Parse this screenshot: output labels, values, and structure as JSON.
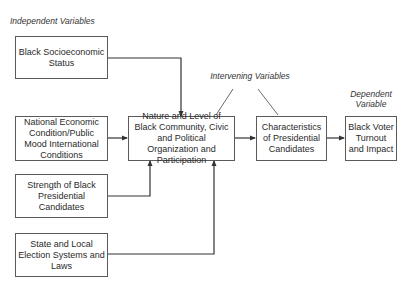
{
  "labels": {
    "independent": "Independent Variables",
    "intervening": "Intervening Variables",
    "dependent_line1": "Dependent",
    "dependent_line2": "Variable"
  },
  "boxes": {
    "socioeconomic": "Black Socioeconomic Status",
    "national": "National Economic Condition/Public Mood International Conditions",
    "strength": "Strength of Black Presidential Candidates",
    "state_local": "State and Local Election Systems and Laws",
    "community": "Nature and Level of Black Community, Civic and Political Organization and Participation",
    "characteristics": "Characteristics of Presidential Candidates",
    "turnout": "Black Voter Turnout and Impact"
  },
  "edges": [
    {
      "from": "socioeconomic",
      "to": "community"
    },
    {
      "from": "national",
      "to": "community"
    },
    {
      "from": "strength",
      "to": "community"
    },
    {
      "from": "state_local",
      "to": "community"
    },
    {
      "from": "community",
      "to": "characteristics"
    },
    {
      "from": "characteristics",
      "to": "turnout"
    }
  ]
}
